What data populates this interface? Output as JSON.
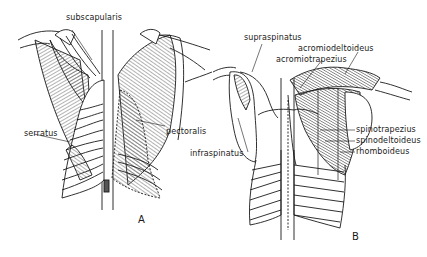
{
  "figure": {
    "panels": [
      {
        "id": "A",
        "label": "A",
        "labels": {
          "subscapularis": "subscapularis",
          "serratus": "serratus",
          "pectoralis": "pectoralis"
        }
      },
      {
        "id": "B",
        "label": "B",
        "labels": {
          "supraspinatus": "supraspinatus",
          "acromiodeltoideus": "acromiodeltoideus",
          "acromiotrapezius": "acromiotrapezius",
          "infraspinatus": "infraspinatus",
          "spinotrapezius": "spinotrapezius",
          "spinodeltoideus": "spinodeltoideus",
          "rhomboideus": "rhomboideus"
        }
      }
    ],
    "colors": {
      "ink": "#1a1a1a",
      "muscle_shade": "#8a8a8a",
      "background": "#ffffff"
    }
  }
}
